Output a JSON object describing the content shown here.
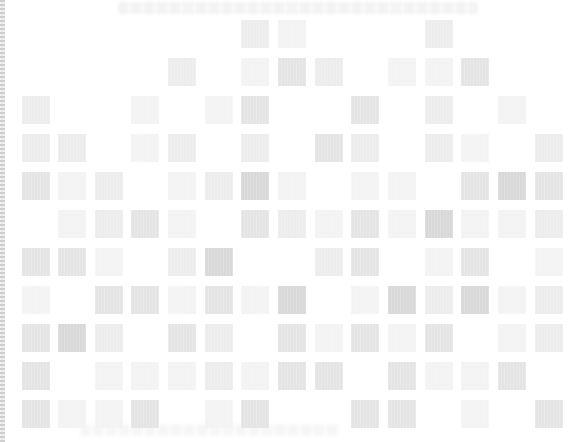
{
  "layout": {
    "cell_size": 28,
    "col_x": [
      22,
      58,
      95,
      131,
      168,
      205,
      241,
      278,
      315,
      351,
      388,
      425,
      461,
      498,
      535
    ],
    "row_y": [
      20,
      58,
      96,
      134,
      172,
      210,
      248,
      286,
      324,
      362,
      400
    ]
  },
  "shades": {
    "1": "#f3f3f3",
    "2": "#ececec",
    "3": "#e4e4e4",
    "4": "#d8d8d8"
  },
  "rows": [
    [
      0,
      0,
      0,
      0,
      0,
      0,
      2,
      1,
      0,
      0,
      0,
      2,
      0,
      0,
      0
    ],
    [
      0,
      0,
      0,
      0,
      2,
      0,
      1,
      3,
      2,
      0,
      1,
      1,
      3,
      0,
      0
    ],
    [
      2,
      0,
      0,
      1,
      0,
      1,
      3,
      0,
      0,
      3,
      0,
      2,
      0,
      1,
      0
    ],
    [
      2,
      2,
      0,
      1,
      2,
      0,
      2,
      0,
      3,
      2,
      0,
      2,
      1,
      0,
      2
    ],
    [
      3,
      1,
      2,
      0,
      1,
      2,
      4,
      1,
      0,
      1,
      1,
      0,
      3,
      4,
      3
    ],
    [
      0,
      1,
      2,
      3,
      1,
      0,
      3,
      2,
      1,
      3,
      1,
      4,
      1,
      1,
      2
    ],
    [
      3,
      3,
      1,
      0,
      2,
      4,
      0,
      0,
      2,
      3,
      0,
      1,
      3,
      0,
      1
    ],
    [
      1,
      0,
      3,
      3,
      1,
      3,
      1,
      4,
      0,
      1,
      4,
      2,
      4,
      1,
      2
    ],
    [
      3,
      4,
      2,
      0,
      3,
      2,
      0,
      3,
      1,
      3,
      1,
      3,
      0,
      1,
      2
    ],
    [
      3,
      0,
      1,
      1,
      1,
      2,
      1,
      3,
      3,
      0,
      3,
      1,
      1,
      3,
      0
    ],
    [
      3,
      1,
      1,
      3,
      0,
      1,
      3,
      0,
      0,
      3,
      3,
      0,
      1,
      0,
      3
    ]
  ]
}
